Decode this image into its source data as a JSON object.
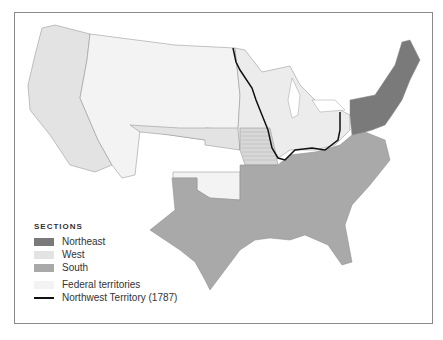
{
  "map": {
    "title": "Sections of the United States",
    "colors": {
      "northeast": "#7a7a7a",
      "west": "#e3e3e3",
      "south": "#a9a9a9",
      "federal": "#f3f3f3",
      "west_light": "#ececec",
      "border": "#8a8a8a",
      "nw_line": "#111111"
    }
  },
  "legend": {
    "title": "SECTIONS",
    "items": [
      {
        "label": "Northeast",
        "color": "#7a7a7a",
        "type": "swatch"
      },
      {
        "label": "West",
        "color": "#e3e3e3",
        "type": "swatch"
      },
      {
        "label": "South",
        "color": "#a9a9a9",
        "type": "swatch"
      },
      {
        "label": "Federal territories",
        "color": "#f3f3f3",
        "type": "swatch"
      },
      {
        "label": "Northwest Territory (1787)",
        "color": "#111111",
        "type": "line"
      }
    ]
  }
}
